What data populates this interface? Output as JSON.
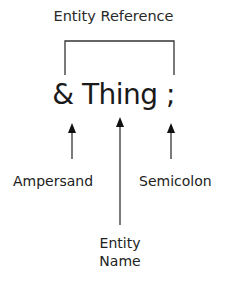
{
  "diagram": {
    "title": "Entity Reference",
    "expression": {
      "ampersand": "&",
      "name": "Thing",
      "semicolon": ";"
    },
    "labels": {
      "ampersand": "Ampersand",
      "semicolon": "Semicolon",
      "entity_name_line1": "Entity",
      "entity_name_line2": "Name"
    },
    "line_color": "#333333"
  }
}
